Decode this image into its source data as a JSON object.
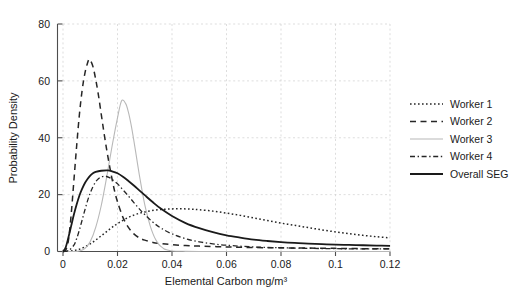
{
  "chart_data": {
    "type": "line",
    "title": "",
    "xlabel": "Elemental Carbon mg/m³",
    "ylabel": "Probability Density",
    "xlim": [
      0,
      0.12
    ],
    "ylim": [
      0,
      80
    ],
    "grid": true,
    "legend_position": "right",
    "xticks": [
      0,
      0.02,
      0.04,
      0.06,
      0.08,
      0.1,
      0.12
    ],
    "xtick_labels": [
      "0",
      "0.02",
      "0.04",
      "0.06",
      "0.08",
      "0.1",
      "0.12"
    ],
    "yticks": [
      0,
      20,
      40,
      60,
      80
    ],
    "ytick_labels": [
      "0",
      "20",
      "40",
      "60",
      "80"
    ],
    "series": [
      {
        "name": "Worker 1",
        "style": "dotted",
        "color": "#262626",
        "peak_x": 0.044,
        "peak_y": 15.0,
        "points": [
          [
            0.0,
            0.0
          ],
          [
            0.002,
            0.1
          ],
          [
            0.004,
            0.3
          ],
          [
            0.006,
            0.8
          ],
          [
            0.008,
            1.6
          ],
          [
            0.01,
            2.7
          ],
          [
            0.012,
            4.0
          ],
          [
            0.014,
            5.5
          ],
          [
            0.016,
            7.0
          ],
          [
            0.018,
            8.5
          ],
          [
            0.02,
            9.8
          ],
          [
            0.023,
            11.5
          ],
          [
            0.026,
            12.8
          ],
          [
            0.029,
            13.7
          ],
          [
            0.032,
            14.3
          ],
          [
            0.035,
            14.7
          ],
          [
            0.038,
            14.9
          ],
          [
            0.041,
            15.0
          ],
          [
            0.044,
            15.0
          ],
          [
            0.047,
            14.9
          ],
          [
            0.05,
            14.7
          ],
          [
            0.055,
            14.2
          ],
          [
            0.06,
            13.5
          ],
          [
            0.065,
            12.7
          ],
          [
            0.07,
            11.8
          ],
          [
            0.075,
            10.9
          ],
          [
            0.08,
            10.0
          ],
          [
            0.085,
            9.2
          ],
          [
            0.09,
            8.4
          ],
          [
            0.095,
            7.6
          ],
          [
            0.1,
            6.9
          ],
          [
            0.105,
            6.3
          ],
          [
            0.11,
            5.7
          ],
          [
            0.115,
            5.2
          ],
          [
            0.12,
            4.8
          ]
        ]
      },
      {
        "name": "Worker 2",
        "style": "dashed",
        "color": "#262626",
        "peak_x": 0.0095,
        "peak_y": 67.5,
        "points": [
          [
            0.0,
            0.0
          ],
          [
            0.001,
            0.5
          ],
          [
            0.002,
            4.0
          ],
          [
            0.003,
            13.0
          ],
          [
            0.004,
            25.0
          ],
          [
            0.005,
            37.0
          ],
          [
            0.006,
            48.0
          ],
          [
            0.007,
            56.5
          ],
          [
            0.008,
            62.5
          ],
          [
            0.009,
            66.3
          ],
          [
            0.0095,
            67.5
          ],
          [
            0.01,
            67.3
          ],
          [
            0.011,
            65.0
          ],
          [
            0.012,
            60.5
          ],
          [
            0.013,
            55.0
          ],
          [
            0.014,
            48.5
          ],
          [
            0.015,
            42.0
          ],
          [
            0.016,
            36.0
          ],
          [
            0.017,
            30.5
          ],
          [
            0.018,
            25.5
          ],
          [
            0.019,
            21.0
          ],
          [
            0.02,
            17.5
          ],
          [
            0.022,
            12.0
          ],
          [
            0.024,
            8.5
          ],
          [
            0.026,
            6.2
          ],
          [
            0.028,
            4.8
          ],
          [
            0.03,
            4.0
          ],
          [
            0.033,
            3.2
          ],
          [
            0.036,
            2.8
          ],
          [
            0.04,
            2.4
          ],
          [
            0.045,
            2.1
          ],
          [
            0.05,
            1.9
          ],
          [
            0.06,
            1.6
          ],
          [
            0.07,
            1.4
          ],
          [
            0.08,
            1.3
          ],
          [
            0.09,
            1.2
          ],
          [
            0.1,
            1.1
          ],
          [
            0.11,
            1.0
          ],
          [
            0.12,
            1.0
          ]
        ]
      },
      {
        "name": "Worker 3",
        "style": "solid-light",
        "color": "#b8b8b8",
        "peak_x": 0.0215,
        "peak_y": 53.0,
        "points": [
          [
            0.0,
            0.0
          ],
          [
            0.004,
            0.0
          ],
          [
            0.006,
            0.2
          ],
          [
            0.008,
            1.0
          ],
          [
            0.01,
            3.5
          ],
          [
            0.012,
            8.5
          ],
          [
            0.014,
            16.0
          ],
          [
            0.016,
            26.0
          ],
          [
            0.018,
            37.0
          ],
          [
            0.02,
            47.0
          ],
          [
            0.0215,
            53.0
          ],
          [
            0.023,
            52.0
          ],
          [
            0.024,
            49.0
          ],
          [
            0.025,
            44.5
          ],
          [
            0.026,
            39.0
          ],
          [
            0.027,
            33.0
          ],
          [
            0.028,
            27.0
          ],
          [
            0.029,
            21.5
          ],
          [
            0.03,
            16.5
          ],
          [
            0.031,
            12.5
          ],
          [
            0.032,
            9.0
          ],
          [
            0.033,
            6.3
          ],
          [
            0.034,
            4.2
          ],
          [
            0.035,
            2.7
          ],
          [
            0.036,
            1.7
          ],
          [
            0.037,
            1.0
          ],
          [
            0.038,
            0.6
          ],
          [
            0.04,
            0.2
          ],
          [
            0.045,
            0.05
          ],
          [
            0.05,
            0.0
          ],
          [
            0.06,
            0.0
          ],
          [
            0.08,
            0.0
          ],
          [
            0.1,
            0.0
          ],
          [
            0.12,
            0.0
          ]
        ]
      },
      {
        "name": "Worker 4",
        "style": "dashdot",
        "color": "#262626",
        "peak_x": 0.0155,
        "peak_y": 26.5,
        "points": [
          [
            0.0,
            0.0
          ],
          [
            0.002,
            0.3
          ],
          [
            0.004,
            2.2
          ],
          [
            0.005,
            4.5
          ],
          [
            0.006,
            7.5
          ],
          [
            0.007,
            11.0
          ],
          [
            0.008,
            14.5
          ],
          [
            0.009,
            17.8
          ],
          [
            0.01,
            20.6
          ],
          [
            0.011,
            22.8
          ],
          [
            0.012,
            24.5
          ],
          [
            0.013,
            25.6
          ],
          [
            0.014,
            26.2
          ],
          [
            0.0155,
            26.5
          ],
          [
            0.017,
            26.0
          ],
          [
            0.018,
            25.4
          ],
          [
            0.02,
            23.8
          ],
          [
            0.022,
            21.7
          ],
          [
            0.024,
            19.5
          ],
          [
            0.026,
            17.2
          ],
          [
            0.028,
            15.0
          ],
          [
            0.03,
            13.0
          ],
          [
            0.033,
            10.3
          ],
          [
            0.036,
            8.2
          ],
          [
            0.04,
            6.2
          ],
          [
            0.045,
            4.5
          ],
          [
            0.05,
            3.4
          ],
          [
            0.055,
            2.7
          ],
          [
            0.06,
            2.2
          ],
          [
            0.07,
            1.6
          ],
          [
            0.08,
            1.3
          ],
          [
            0.09,
            1.1
          ],
          [
            0.1,
            1.0
          ],
          [
            0.11,
            0.9
          ],
          [
            0.12,
            0.9
          ]
        ]
      },
      {
        "name": "Overall SEG",
        "style": "solid",
        "color": "#1a1a1a",
        "peak_x": 0.0165,
        "peak_y": 28.5,
        "points": [
          [
            0.0,
            0.0
          ],
          [
            0.001,
            1.5
          ],
          [
            0.002,
            5.0
          ],
          [
            0.003,
            9.0
          ],
          [
            0.004,
            13.0
          ],
          [
            0.005,
            16.5
          ],
          [
            0.006,
            19.6
          ],
          [
            0.007,
            22.0
          ],
          [
            0.008,
            24.0
          ],
          [
            0.009,
            25.5
          ],
          [
            0.01,
            26.7
          ],
          [
            0.011,
            27.5
          ],
          [
            0.012,
            28.0
          ],
          [
            0.014,
            28.4
          ],
          [
            0.0165,
            28.5
          ],
          [
            0.018,
            28.2
          ],
          [
            0.02,
            27.5
          ],
          [
            0.022,
            26.3
          ],
          [
            0.024,
            24.8
          ],
          [
            0.026,
            23.2
          ],
          [
            0.028,
            21.5
          ],
          [
            0.03,
            19.8
          ],
          [
            0.033,
            17.3
          ],
          [
            0.036,
            15.0
          ],
          [
            0.04,
            12.5
          ],
          [
            0.045,
            10.0
          ],
          [
            0.05,
            8.2
          ],
          [
            0.055,
            6.8
          ],
          [
            0.06,
            5.7
          ],
          [
            0.065,
            4.9
          ],
          [
            0.07,
            4.2
          ],
          [
            0.075,
            3.7
          ],
          [
            0.08,
            3.3
          ],
          [
            0.085,
            3.0
          ],
          [
            0.09,
            2.8
          ],
          [
            0.095,
            2.6
          ],
          [
            0.1,
            2.4
          ],
          [
            0.105,
            2.3
          ],
          [
            0.11,
            2.2
          ],
          [
            0.115,
            2.1
          ],
          [
            0.12,
            2.0
          ]
        ]
      }
    ]
  },
  "legend": {
    "items": [
      {
        "label": "Worker 1"
      },
      {
        "label": "Worker 2"
      },
      {
        "label": "Worker 3"
      },
      {
        "label": "Worker 4"
      },
      {
        "label": "Overall SEG"
      }
    ]
  }
}
